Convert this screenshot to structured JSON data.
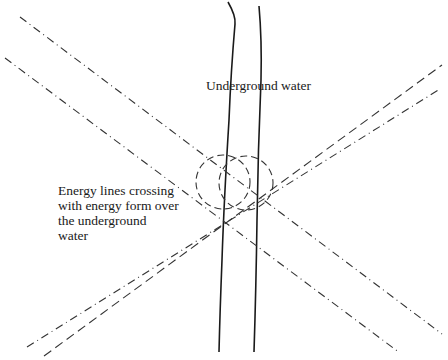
{
  "diagram": {
    "labels": {
      "underground_water": "Underground water",
      "energy_crossing": [
        "Energy lines crossing",
        "with energy form over",
        "the underground",
        "water"
      ]
    },
    "colors": {
      "background": "#ffffff",
      "stroke": "#1a1a1a",
      "text": "#1a1a1a"
    },
    "elements": {
      "stream_banks": 2,
      "energy_line_pairs": 2,
      "energy_form_circles": 2
    }
  }
}
